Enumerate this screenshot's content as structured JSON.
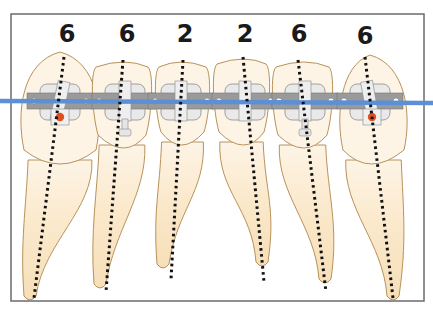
{
  "diagram": {
    "title": "",
    "colors": {
      "frame": "#6b6b6b",
      "tooth_fill_crown": "#fdf4e6",
      "tooth_fill_root": "#f7e3bf",
      "tooth_outline": "#b9925a",
      "bracket": "#9a9a9a",
      "bracket_slot": "#e9e9e9",
      "archwire": "#5b8fd6",
      "axis_dots": "#111111",
      "marker": "#e0501e"
    },
    "teeth": [
      {
        "id": "tooth-1",
        "label": "6",
        "has_marker": true,
        "has_hook": false
      },
      {
        "id": "tooth-2",
        "label": "6",
        "has_marker": false,
        "has_hook": true
      },
      {
        "id": "tooth-3",
        "label": "2",
        "has_marker": false,
        "has_hook": false
      },
      {
        "id": "tooth-4",
        "label": "2",
        "has_marker": false,
        "has_hook": false
      },
      {
        "id": "tooth-5",
        "label": "6",
        "has_marker": false,
        "has_hook": true
      },
      {
        "id": "tooth-6",
        "label": "6",
        "has_marker": true,
        "has_hook": false
      }
    ]
  }
}
